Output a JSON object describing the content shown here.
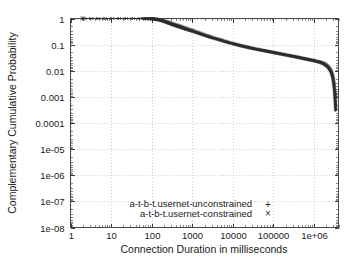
{
  "chart_data": {
    "type": "line",
    "title": "",
    "xlabel": "Connection Duration in milliseconds",
    "ylabel": "Complementary Cumulative Probability",
    "xscale": "log",
    "yscale": "log",
    "xlim": [
      1,
      4000000
    ],
    "ylim": [
      1e-08,
      1
    ],
    "grid": true,
    "legend_position": "bottom-center",
    "x_tick_labels": [
      "1",
      "10",
      "100",
      "1000",
      "10000",
      "100000",
      "1e+06"
    ],
    "x_tick_values": [
      1,
      10,
      100,
      1000,
      10000,
      100000,
      1000000
    ],
    "y_tick_labels": [
      "1",
      "0.1",
      "0.01",
      "0.001",
      "0.0001",
      "1e-05",
      "1e-06",
      "1e-07",
      "1e-08"
    ],
    "y_tick_values": [
      1,
      0.1,
      0.01,
      0.001,
      0.0001,
      1e-05,
      1e-06,
      1e-07,
      1e-08
    ],
    "series": [
      {
        "name": "a-t-b-t.usernet-unconstrained",
        "marker": "+",
        "color": "#2b2b2b",
        "points": [
          [
            2,
            1.0
          ],
          [
            60,
            1.0
          ],
          [
            100,
            0.99
          ],
          [
            130,
            0.92
          ],
          [
            180,
            0.8
          ],
          [
            250,
            0.66
          ],
          [
            350,
            0.54
          ],
          [
            500,
            0.45
          ],
          [
            700,
            0.38
          ],
          [
            1000,
            0.32
          ],
          [
            1500,
            0.26
          ],
          [
            2200,
            0.215
          ],
          [
            3000,
            0.185
          ],
          [
            4500,
            0.155
          ],
          [
            6500,
            0.13
          ],
          [
            10000,
            0.108
          ],
          [
            15000,
            0.092
          ],
          [
            22000,
            0.08
          ],
          [
            32000,
            0.07
          ],
          [
            50000,
            0.061
          ],
          [
            75000,
            0.054
          ],
          [
            110000,
            0.048
          ],
          [
            160000,
            0.043
          ],
          [
            240000,
            0.038
          ],
          [
            350000,
            0.034
          ],
          [
            500000,
            0.03
          ],
          [
            700000,
            0.027
          ],
          [
            1000000,
            0.024
          ],
          [
            1400000,
            0.021
          ],
          [
            1800000,
            0.018
          ],
          [
            2200000,
            0.014
          ],
          [
            2600000,
            0.0095
          ],
          [
            2900000,
            0.0055
          ],
          [
            3100000,
            0.0028
          ],
          [
            3250000,
            0.0013
          ],
          [
            3350000,
            0.0006
          ],
          [
            3400000,
            0.0003
          ]
        ]
      },
      {
        "name": "a-t-b-t.usernet-constrained",
        "marker": "×",
        "color": "#2b2b2b",
        "points": [
          [
            2,
            1.0
          ],
          [
            60,
            1.0
          ],
          [
            100,
            0.99
          ],
          [
            130,
            0.94
          ],
          [
            180,
            0.85
          ],
          [
            250,
            0.73
          ],
          [
            350,
            0.61
          ],
          [
            500,
            0.51
          ],
          [
            700,
            0.42
          ],
          [
            1000,
            0.35
          ],
          [
            1500,
            0.28
          ],
          [
            2200,
            0.225
          ],
          [
            3000,
            0.19
          ],
          [
            4500,
            0.158
          ],
          [
            6500,
            0.132
          ],
          [
            10000,
            0.11
          ],
          [
            15000,
            0.093
          ],
          [
            22000,
            0.081
          ],
          [
            32000,
            0.071
          ],
          [
            50000,
            0.062
          ],
          [
            75000,
            0.055
          ],
          [
            110000,
            0.049
          ],
          [
            160000,
            0.0435
          ],
          [
            240000,
            0.0385
          ],
          [
            350000,
            0.0345
          ],
          [
            500000,
            0.0305
          ],
          [
            700000,
            0.0275
          ],
          [
            1000000,
            0.0245
          ],
          [
            1400000,
            0.0215
          ],
          [
            1800000,
            0.0185
          ],
          [
            2200000,
            0.0145
          ],
          [
            2600000,
            0.01
          ],
          [
            2900000,
            0.006
          ],
          [
            3100000,
            0.003
          ],
          [
            3250000,
            0.0014
          ],
          [
            3350000,
            0.00065
          ],
          [
            3400000,
            0.00032
          ]
        ]
      }
    ]
  }
}
